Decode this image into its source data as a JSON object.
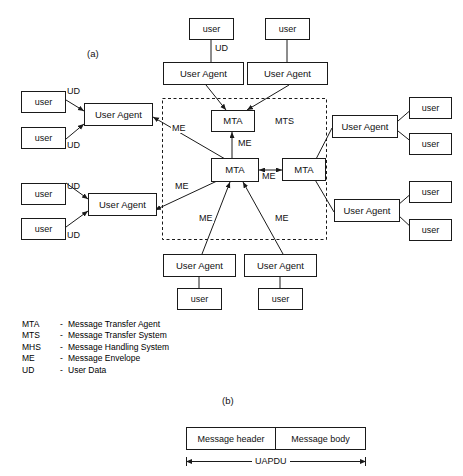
{
  "figure": {
    "panel_a_label": "(a)",
    "panel_b_label": "(b)"
  },
  "labels": {
    "user": "user",
    "user_agent": "User Agent",
    "mta": "MTA",
    "mts": "MTS",
    "me": "ME",
    "ud": "UD"
  },
  "diagram_a": {
    "mts_region_label": "MTS",
    "nodes": {
      "top_user_left": "user",
      "top_user_right": "user",
      "top_ua_left": "User Agent",
      "top_ua_right": "User Agent",
      "left_upper_user_1": "user",
      "left_upper_user_2": "user",
      "left_upper_ua": "User Agent",
      "left_lower_user_1": "user",
      "left_lower_user_2": "user",
      "left_lower_ua": "User Agent",
      "right_upper_ua": "User Agent",
      "right_upper_user_1": "user",
      "right_upper_user_2": "user",
      "right_lower_ua": "User Agent",
      "right_lower_user_1": "user",
      "right_lower_user_2": "user",
      "mta_top": "MTA",
      "mta_center": "MTA",
      "mta_right": "MTA",
      "bottom_ua_left": "User Agent",
      "bottom_ua_right": "User Agent",
      "bottom_user_left": "user",
      "bottom_user_right": "user"
    },
    "edge_labels": {
      "ud_top": "UD",
      "ud_left_upper_1": "UD",
      "ud_left_upper_2": "UD",
      "ud_left_lower_1": "UD",
      "ud_left_lower_2": "UD",
      "me_left_upper": "ME",
      "me_left_lower": "ME",
      "me_vertical": "ME",
      "me_horizontal": "ME",
      "me_bottom_left": "ME",
      "me_bottom_right": "ME"
    }
  },
  "legend": {
    "rows": [
      {
        "abbr": "MTA",
        "dash": "-",
        "text": "Message Transfer Agent"
      },
      {
        "abbr": "MTS",
        "dash": "-",
        "text": "Message Transfer System"
      },
      {
        "abbr": "MHS",
        "dash": "-",
        "text": "Message Handling System"
      },
      {
        "abbr": "ME",
        "dash": "-",
        "text": "Message Envelope"
      },
      {
        "abbr": "UD",
        "dash": "-",
        "text": "User Data"
      }
    ]
  },
  "diagram_b": {
    "cells": [
      {
        "label": "Message header"
      },
      {
        "label": "Message body"
      }
    ],
    "span_label": "UAPDU"
  },
  "colors": {
    "stroke": "#1a1a1a",
    "text": "#111111",
    "background": "#ffffff"
  }
}
